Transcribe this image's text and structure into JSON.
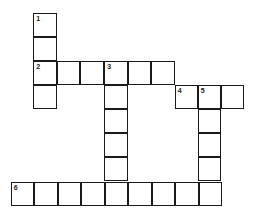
{
  "puzzle": {
    "type": "crossword",
    "clue_numbers": [
      "1",
      "2",
      "3",
      "4",
      "5",
      "6"
    ],
    "cells": [
      {
        "x": 34,
        "y": 14,
        "num": "1"
      },
      {
        "x": 34,
        "y": 38,
        "num": ""
      },
      {
        "x": 34,
        "y": 62,
        "num": "2"
      },
      {
        "x": 34,
        "y": 86,
        "num": ""
      },
      {
        "x": 57.5,
        "y": 62,
        "num": ""
      },
      {
        "x": 81,
        "y": 62,
        "num": ""
      },
      {
        "x": 105,
        "y": 62,
        "num": "3"
      },
      {
        "x": 128.5,
        "y": 62,
        "num": ""
      },
      {
        "x": 152,
        "y": 62,
        "num": ""
      },
      {
        "x": 105,
        "y": 86,
        "num": ""
      },
      {
        "x": 105,
        "y": 110,
        "num": ""
      },
      {
        "x": 105,
        "y": 134,
        "num": ""
      },
      {
        "x": 105,
        "y": 158,
        "num": ""
      },
      {
        "x": 175.5,
        "y": 86,
        "num": "4"
      },
      {
        "x": 198.5,
        "y": 86,
        "num": "5"
      },
      {
        "x": 221.5,
        "y": 86,
        "num": ""
      },
      {
        "x": 198.5,
        "y": 110,
        "num": ""
      },
      {
        "x": 198.5,
        "y": 134,
        "num": ""
      },
      {
        "x": 198.5,
        "y": 158,
        "num": ""
      },
      {
        "x": 11.5,
        "y": 183,
        "num": "6"
      },
      {
        "x": 35,
        "y": 183,
        "num": ""
      },
      {
        "x": 58.5,
        "y": 183,
        "num": ""
      },
      {
        "x": 82,
        "y": 183,
        "num": ""
      },
      {
        "x": 105.5,
        "y": 183,
        "num": ""
      },
      {
        "x": 129,
        "y": 183,
        "num": ""
      },
      {
        "x": 152.5,
        "y": 183,
        "num": ""
      },
      {
        "x": 176,
        "y": 183,
        "num": ""
      },
      {
        "x": 199.5,
        "y": 183,
        "num": ""
      }
    ]
  }
}
